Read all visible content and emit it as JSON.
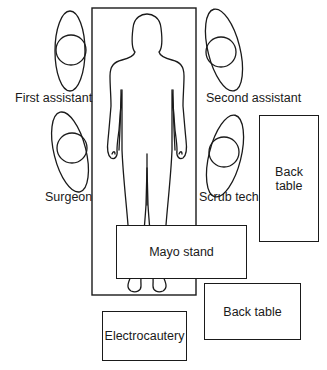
{
  "diagram": {
    "type": "operating-room-layout",
    "elements": {
      "or_table": {
        "label": ""
      },
      "patient": {
        "label": ""
      },
      "first_assistant": {
        "label": "First assistant"
      },
      "second_assistant": {
        "label": "Second assistant"
      },
      "surgeon": {
        "label": "Surgeon"
      },
      "scrub_tech": {
        "label": "Scrub tech."
      },
      "back_table_right": {
        "label": "Back table"
      },
      "mayo_stand": {
        "label": "Mayo stand"
      },
      "back_table_bottom": {
        "label": "Back table"
      },
      "electrocautery": {
        "label": "Electrocautery"
      }
    },
    "stroke_color": "#1a1a1a",
    "background_color": "#ffffff"
  }
}
